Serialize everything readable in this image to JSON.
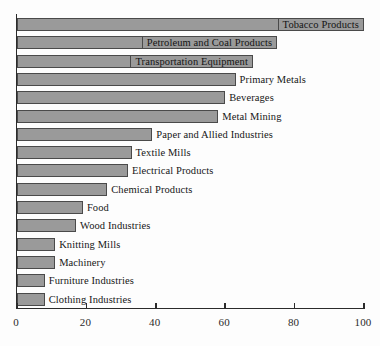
{
  "chart_data": {
    "type": "bar",
    "orientation": "horizontal",
    "title": "",
    "subtitle": "",
    "xlabel": "",
    "ylabel": "",
    "xlim": [
      0,
      100
    ],
    "ylim": null,
    "grid": false,
    "legend": null,
    "xticks": [
      "0",
      "20",
      "40",
      "60",
      "80",
      "100"
    ],
    "xtick_values": [
      0,
      20,
      40,
      60,
      80,
      100
    ],
    "bar_color": "#9a9a9a",
    "bar_edge_color": "#4a4a4a",
    "axis_color": "#2b2b2b",
    "background_color": "#fdfdfd",
    "categories": [
      "Tobacco Products",
      "Petroleum and Coal Products",
      "Transportation Equipment",
      "Primary Metals",
      "Beverages",
      "Metal Mining",
      "Paper and Allied Industries",
      "Textile Mills",
      "Electrical Products",
      "Chemical Products",
      "Food",
      "Wood Industries",
      "Knitting Mills",
      "Machinery",
      "Furniture Industries",
      "Clothing Industries"
    ],
    "values": [
      100,
      75,
      68,
      63,
      60,
      58,
      39,
      33,
      32,
      26,
      19,
      17,
      11,
      11,
      8,
      8
    ],
    "label_placement": [
      "inside",
      "inside",
      "inside",
      "outside",
      "outside",
      "outside",
      "outside",
      "outside",
      "outside",
      "outside",
      "outside",
      "outside",
      "outside",
      "outside",
      "outside",
      "outside"
    ]
  }
}
